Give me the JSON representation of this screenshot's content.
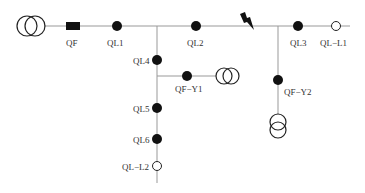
{
  "diagram": {
    "colors": {
      "line": "#999999",
      "symbol": "#111111",
      "background": "#ffffff"
    },
    "labels": {
      "qf": "QF",
      "ql1": "QL1",
      "ql2": "QL2",
      "ql3": "QL3",
      "ql_l1": "QL−L1",
      "ql4": "QL4",
      "qf_y1": "QF−Y1",
      "qf_y2": "QF−Y2",
      "ql5": "QL5",
      "ql6": "QL6",
      "ql_l2": "QL−L2"
    },
    "icons": {
      "source_transformer": "transformer-icon",
      "breaker": "circuit-breaker-icon",
      "fault": "lightning-fault-icon",
      "load_switch": "switch-closed-icon",
      "open_switch": "switch-open-icon"
    }
  }
}
